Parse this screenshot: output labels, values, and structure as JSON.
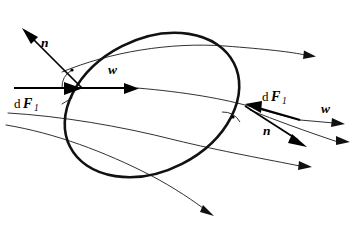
{
  "figure": {
    "kind": "fluid-flow-around-body-diagram",
    "background_color": "#ffffff",
    "ink_color": "#000000",
    "width": 364,
    "height": 225
  },
  "labels": {
    "normal_left": "n",
    "normal_right": "n",
    "velocity_left": "w",
    "velocity_right": "w",
    "force_left_d": "d",
    "force_left_F": "F",
    "force_left_sub": "1",
    "force_right_d": "d",
    "force_right_F": "F",
    "force_right_sub": "1"
  },
  "annotations": {
    "right_angle_left": "right-angle-marker",
    "right_angle_right": "right-angle-marker"
  },
  "elements": {
    "body_outline": "closed tilted oval body",
    "streamlines_count": 5,
    "vectors_count": 6
  }
}
